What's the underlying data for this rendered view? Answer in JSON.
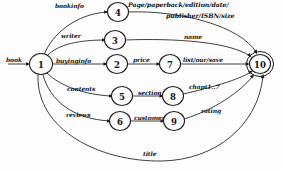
{
  "diagram": {
    "type": "state-transition-graph",
    "title": "",
    "nodes": [
      {
        "id": "1",
        "label": "1",
        "cx": 41,
        "cy": 64,
        "r": 10.5,
        "accepting": false
      },
      {
        "id": "2",
        "label": "2",
        "cx": 117,
        "cy": 64,
        "r": 9.5,
        "accepting": false
      },
      {
        "id": "3",
        "label": "3",
        "cx": 115,
        "cy": 40,
        "r": 9.5,
        "accepting": false
      },
      {
        "id": "4",
        "label": "4",
        "cx": 118,
        "cy": 12,
        "r": 9.5,
        "accepting": false
      },
      {
        "id": "5",
        "label": "5",
        "cx": 122,
        "cy": 96,
        "r": 9.5,
        "accepting": false
      },
      {
        "id": "6",
        "label": "6",
        "cx": 120,
        "cy": 121,
        "r": 9.5,
        "accepting": false
      },
      {
        "id": "7",
        "label": "7",
        "cx": 170,
        "cy": 64,
        "r": 9.5,
        "accepting": false
      },
      {
        "id": "8",
        "label": "8",
        "cx": 173,
        "cy": 96,
        "r": 9.5,
        "accepting": false
      },
      {
        "id": "9",
        "label": "9",
        "cx": 174,
        "cy": 121,
        "r": 9.5,
        "accepting": false
      },
      {
        "id": "10",
        "label": "10",
        "cx": 260,
        "cy": 64,
        "r": 10.0,
        "accepting": true
      }
    ],
    "edges": [
      {
        "from": "start",
        "to": "1",
        "label": "book"
      },
      {
        "from": "1",
        "to": "4",
        "label": "bookinfo"
      },
      {
        "from": "1",
        "to": "3",
        "label": "writer"
      },
      {
        "from": "1",
        "to": "2",
        "label": "buyinginfo"
      },
      {
        "from": "1",
        "to": "5",
        "label": "contents"
      },
      {
        "from": "1",
        "to": "6",
        "label": "reviews"
      },
      {
        "from": "4",
        "to": "10",
        "label": "Page/paperback/edition/date/ publisher/ISBN/size"
      },
      {
        "from": "3",
        "to": "10",
        "label": "name"
      },
      {
        "from": "2",
        "to": "7",
        "label": "price"
      },
      {
        "from": "7",
        "to": "10",
        "label": "list/our/save"
      },
      {
        "from": "5",
        "to": "8",
        "label": "section"
      },
      {
        "from": "8",
        "to": "10",
        "label": "chapt1..7"
      },
      {
        "from": "6",
        "to": "9",
        "label": "customer"
      },
      {
        "from": "9",
        "to": "10",
        "label": "rating"
      },
      {
        "from": "1",
        "to": "10",
        "label": "title"
      }
    ],
    "labels": {
      "book": "book",
      "bookinfo": "bookinfo",
      "writer": "writer",
      "buyinginfo": "buyinginfo",
      "contents": "contents",
      "reviews": "reviews",
      "page_attrs_line1": "Page/paperback/edition/date/",
      "page_attrs_line2": "publisher/ISBN/size",
      "name": "name",
      "price": "price",
      "list_our_save": "list/our/save",
      "section": "section",
      "chapter": "chapt1..7",
      "customer": "customer",
      "rating": "rating",
      "title": "title"
    },
    "colors": {
      "stroke": "#1e1e1e",
      "edge": "#2a2a2a",
      "node_fill": "#ffffff",
      "background": "#fdfdfd",
      "text": "#141414"
    }
  }
}
